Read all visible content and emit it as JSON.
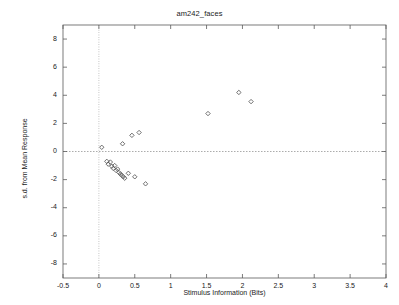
{
  "chart_data": {
    "type": "scatter",
    "title": "am242_faces",
    "xlabel": "Stimulus Information (Bits)",
    "ylabel": "s.d. from Mean Response",
    "xlim": [
      -0.5,
      4
    ],
    "ylim": [
      -9,
      9
    ],
    "xticks": [
      -0.5,
      0,
      0.5,
      1,
      1.5,
      2,
      2.5,
      3,
      3.5,
      4
    ],
    "xtick_labels": [
      "-0.5",
      "0",
      "0.5",
      "1",
      "1.5",
      "2",
      "2.5",
      "3",
      "3.5",
      "4"
    ],
    "yticks": [
      8,
      6,
      4,
      2,
      0,
      -2,
      -4,
      -6,
      -8
    ],
    "ytick_labels": [
      "8",
      "6",
      "4",
      "2",
      "0",
      "-2",
      "-4",
      "-6",
      "-8"
    ],
    "grid": false,
    "legend": null,
    "marker": "open-diamond",
    "marker_color": "#555555",
    "reference_lines": [
      {
        "name": "zero-horizontal",
        "axis": "y",
        "value": 0,
        "style": "dashed"
      },
      {
        "name": "zero-vertical",
        "axis": "x",
        "value": 0,
        "style": "dotted"
      }
    ],
    "series": [
      {
        "name": "faces",
        "points": [
          {
            "x": 0.04,
            "y": 0.3
          },
          {
            "x": 0.11,
            "y": -0.7
          },
          {
            "x": 0.13,
            "y": -0.9
          },
          {
            "x": 0.16,
            "y": -0.75
          },
          {
            "x": 0.18,
            "y": -1.05
          },
          {
            "x": 0.2,
            "y": -1.2
          },
          {
            "x": 0.22,
            "y": -1.0
          },
          {
            "x": 0.24,
            "y": -1.35
          },
          {
            "x": 0.26,
            "y": -1.25
          },
          {
            "x": 0.28,
            "y": -1.5
          },
          {
            "x": 0.3,
            "y": -1.6
          },
          {
            "x": 0.32,
            "y": -1.7
          },
          {
            "x": 0.34,
            "y": -1.8
          },
          {
            "x": 0.36,
            "y": -1.9
          },
          {
            "x": 0.33,
            "y": 0.55
          },
          {
            "x": 0.41,
            "y": -1.55
          },
          {
            "x": 0.46,
            "y": 1.15
          },
          {
            "x": 0.5,
            "y": -1.8
          },
          {
            "x": 0.56,
            "y": 1.35
          },
          {
            "x": 0.65,
            "y": -2.3
          },
          {
            "x": 1.52,
            "y": 2.7
          },
          {
            "x": 1.95,
            "y": 4.2
          },
          {
            "x": 2.12,
            "y": 3.55
          }
        ]
      }
    ]
  }
}
